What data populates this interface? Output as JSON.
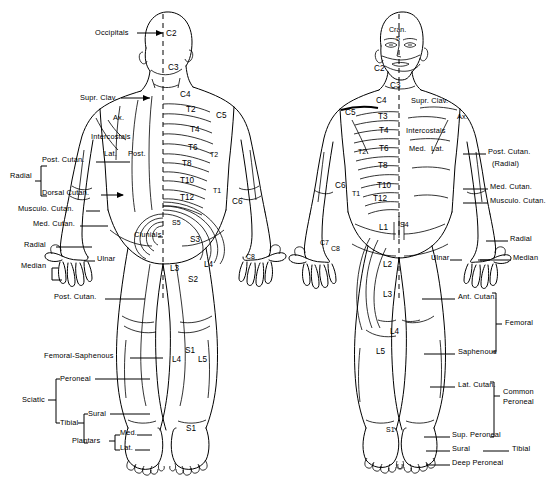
{
  "figure": {
    "views": [
      {
        "name": "posterior",
        "caption": "Posterior view"
      },
      {
        "name": "anterior",
        "caption": "Anterior view"
      }
    ]
  },
  "posterior": {
    "dermatomes": [
      {
        "id": "C2",
        "label": "C2",
        "x": 166,
        "y": 34
      },
      {
        "id": "C3",
        "label": "C3",
        "x": 168,
        "y": 68
      },
      {
        "id": "C4",
        "label": "C4",
        "x": 180,
        "y": 95
      },
      {
        "id": "T2",
        "label": "T2",
        "x": 186,
        "y": 110
      },
      {
        "id": "T4",
        "label": "T4",
        "x": 190,
        "y": 130
      },
      {
        "id": "T6",
        "label": "T6",
        "x": 188,
        "y": 148
      },
      {
        "id": "T8",
        "label": "T8",
        "x": 182,
        "y": 164
      },
      {
        "id": "T10",
        "label": "T10",
        "x": 180,
        "y": 181
      },
      {
        "id": "T12",
        "label": "T12",
        "x": 180,
        "y": 198
      },
      {
        "id": "C5",
        "label": "C5",
        "x": 216,
        "y": 116
      },
      {
        "id": "T2b",
        "label": "T2",
        "x": 210,
        "y": 155
      },
      {
        "id": "T1",
        "label": "T1",
        "x": 213,
        "y": 191
      },
      {
        "id": "C6",
        "label": "C6",
        "x": 232,
        "y": 202
      },
      {
        "id": "C8",
        "label": "C8",
        "x": 246,
        "y": 257
      },
      {
        "id": "S5",
        "label": "S5",
        "x": 172,
        "y": 223
      },
      {
        "id": "S3",
        "label": "S3",
        "x": 190,
        "y": 240
      },
      {
        "id": "S2",
        "label": "S2",
        "x": 188,
        "y": 280
      },
      {
        "id": "L3",
        "label": "L3",
        "x": 170,
        "y": 269
      },
      {
        "id": "L4",
        "label": "L4",
        "x": 204,
        "y": 265
      },
      {
        "id": "L4b",
        "label": "L4",
        "x": 172,
        "y": 360
      },
      {
        "id": "S1",
        "label": "S1",
        "x": 185,
        "y": 351
      },
      {
        "id": "L5",
        "label": "L5",
        "x": 198,
        "y": 360
      },
      {
        "id": "S1b",
        "label": "S1",
        "x": 186,
        "y": 429
      }
    ],
    "nerve_labels": [
      {
        "id": "occipitals",
        "label": "Occipitals",
        "x": 95,
        "y": 30
      },
      {
        "id": "supr-clav",
        "label": "Supr. Clav.",
        "x": 80,
        "y": 95
      },
      {
        "id": "ax",
        "label": "Ax.",
        "x": 113,
        "y": 117
      },
      {
        "id": "intercostals",
        "label": "Intercostals",
        "x": 91,
        "y": 136
      },
      {
        "id": "lat",
        "label": "Lat.",
        "x": 104,
        "y": 153
      },
      {
        "id": "post",
        "label": "Post.",
        "x": 128,
        "y": 153
      },
      {
        "id": "post-cutan",
        "label": "Post. Cutan.",
        "x": 42,
        "y": 159
      },
      {
        "id": "radial-upper",
        "label": "Radial",
        "x": 14,
        "y": 175
      },
      {
        "id": "dorsal-cutan",
        "label": "Dorsal Cutan.",
        "x": 42,
        "y": 192
      },
      {
        "id": "musculo-cutan",
        "label": "Musculo. Cutan.",
        "x": 22,
        "y": 208
      },
      {
        "id": "med-cutan",
        "label": "Med. Cutan.",
        "x": 35,
        "y": 223
      },
      {
        "id": "radial-hand",
        "label": "Radial",
        "x": 27,
        "y": 244
      },
      {
        "id": "ulnar",
        "label": "Ulnar",
        "x": 97,
        "y": 258
      },
      {
        "id": "median",
        "label": "Median",
        "x": 27,
        "y": 265
      },
      {
        "id": "clunials",
        "label": "Clunials",
        "x": 134,
        "y": 234
      },
      {
        "id": "post-cutan-leg",
        "label": "Post. Cutan.",
        "x": 57,
        "y": 296
      },
      {
        "id": "femoral-saph",
        "label": "Femoral-Saphenous",
        "x": 44,
        "y": 355
      },
      {
        "id": "peroneal",
        "label": "Peroneal",
        "x": 60,
        "y": 376
      },
      {
        "id": "sciatic",
        "label": "Sciatic",
        "x": 25,
        "y": 397
      },
      {
        "id": "tibial",
        "label": "Tibial",
        "x": 60,
        "y": 420
      },
      {
        "id": "sural",
        "label": "Sural",
        "x": 87,
        "y": 411
      },
      {
        "id": "plantars",
        "label": "Plantars",
        "x": 75,
        "y": 440
      },
      {
        "id": "plantar-med",
        "label": "Med.",
        "x": 122,
        "y": 432
      },
      {
        "id": "plantar-lat",
        "label": "Lat.",
        "x": 122,
        "y": 447
      }
    ]
  },
  "anterior": {
    "dermatomes": [
      {
        "id": "cran5-a",
        "label": "Cran.",
        "x": 392,
        "y": 29
      },
      {
        "id": "cran5-b",
        "label": "5",
        "x": 399,
        "y": 39
      },
      {
        "id": "C2",
        "label": "C2",
        "x": 377,
        "y": 69
      },
      {
        "id": "C3",
        "label": "C3",
        "x": 392,
        "y": 86
      },
      {
        "id": "C4",
        "label": "C4",
        "x": 378,
        "y": 101
      },
      {
        "id": "T3",
        "label": "T3",
        "x": 380,
        "y": 117
      },
      {
        "id": "T4",
        "label": "T4",
        "x": 381,
        "y": 131
      },
      {
        "id": "T6",
        "label": "T6",
        "x": 381,
        "y": 149
      },
      {
        "id": "T8",
        "label": "T8",
        "x": 380,
        "y": 166
      },
      {
        "id": "T10",
        "label": "T10",
        "x": 379,
        "y": 186
      },
      {
        "id": "T12",
        "label": "T12",
        "x": 375,
        "y": 199
      },
      {
        "id": "C5",
        "label": "C5",
        "x": 347,
        "y": 113
      },
      {
        "id": "T2",
        "label": "T2",
        "x": 359,
        "y": 152
      },
      {
        "id": "C6",
        "label": "C6",
        "x": 337,
        "y": 186
      },
      {
        "id": "T1",
        "label": "T1",
        "x": 352,
        "y": 194
      },
      {
        "id": "C7",
        "label": "C7",
        "x": 322,
        "y": 242
      },
      {
        "id": "C8",
        "label": "C8",
        "x": 333,
        "y": 248
      },
      {
        "id": "S4",
        "label": "S4",
        "x": 402,
        "y": 225
      },
      {
        "id": "L1",
        "label": "L1",
        "x": 381,
        "y": 228
      },
      {
        "id": "L2",
        "label": "L2",
        "x": 385,
        "y": 265
      },
      {
        "id": "L3",
        "label": "L3",
        "x": 385,
        "y": 295
      },
      {
        "id": "L4",
        "label": "L4",
        "x": 392,
        "y": 332
      },
      {
        "id": "L5",
        "label": "L5",
        "x": 378,
        "y": 352
      },
      {
        "id": "S1",
        "label": "S1",
        "x": 386,
        "y": 430
      }
    ],
    "nerve_labels": [
      {
        "id": "supr-clav",
        "label": "Supr. Clav.",
        "x": 411,
        "y": 100
      },
      {
        "id": "ax",
        "label": "Ax.",
        "x": 457,
        "y": 116
      },
      {
        "id": "intercostals",
        "label": "Intercostals",
        "x": 408,
        "y": 130
      },
      {
        "id": "med",
        "label": "Med.",
        "x": 409,
        "y": 148
      },
      {
        "id": "lat",
        "label": "Lat.",
        "x": 431,
        "y": 148
      },
      {
        "id": "post-cutan",
        "label": "Post. Cutan.",
        "x": 488,
        "y": 151
      },
      {
        "id": "post-cutan-rad",
        "label": "(Radial)",
        "x": 491,
        "y": 163
      },
      {
        "id": "med-cutan",
        "label": "Med. Cutan.",
        "x": 491,
        "y": 186
      },
      {
        "id": "musculo-cutan",
        "label": "Musculo. Cutan.",
        "x": 491,
        "y": 200
      },
      {
        "id": "radial",
        "label": "Radial",
        "x": 510,
        "y": 238
      },
      {
        "id": "ulnar",
        "label": "Ulnar",
        "x": 458,
        "y": 257
      },
      {
        "id": "median",
        "label": "Median",
        "x": 513,
        "y": 257
      },
      {
        "id": "ant-cutan",
        "label": "Ant. Cutan.",
        "x": 458,
        "y": 296
      },
      {
        "id": "femoral",
        "label": "Femoral",
        "x": 506,
        "y": 322
      },
      {
        "id": "saphenous",
        "label": "Saphenous",
        "x": 458,
        "y": 351
      },
      {
        "id": "lat-cutan",
        "label": "Lat. Cutan.",
        "x": 458,
        "y": 384
      },
      {
        "id": "common",
        "label": "Common",
        "x": 503,
        "y": 391
      },
      {
        "id": "common-per",
        "label": "Peroneal",
        "x": 503,
        "y": 401
      },
      {
        "id": "sup-peroneal",
        "label": "Sup. Peroneal",
        "x": 453,
        "y": 434
      },
      {
        "id": "sural",
        "label": "Sural",
        "x": 453,
        "y": 448
      },
      {
        "id": "tibial",
        "label": "Tibial",
        "x": 512,
        "y": 448
      },
      {
        "id": "deep-peroneal",
        "label": "Deep Peroneal",
        "x": 453,
        "y": 462
      }
    ]
  },
  "colors": {
    "ink": "#000000",
    "background": "#ffffff"
  }
}
